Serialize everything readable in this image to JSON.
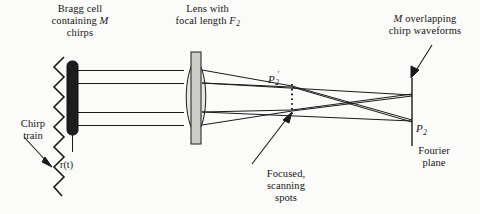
{
  "figure": {
    "type": "optical-system-diagram",
    "background_color": "#fbfbf9",
    "ink_color": "#161616"
  },
  "labels": {
    "bragg_cell": {
      "line1": "Bragg cell",
      "line2_pre": "containing ",
      "line2_italic": "M",
      "line3": "chirps"
    },
    "lens": {
      "line1": "Lens with",
      "line2_pre": "focal length ",
      "line2_italic": "F",
      "line2_sub": "2"
    },
    "overlapping": {
      "line1_italic": "M",
      "line1_post": " overlapping",
      "line2": "chirp waveforms"
    },
    "chirp_train": {
      "line1": "Chirp",
      "line2": "train"
    },
    "input_signal": "r(t)",
    "p2_prime": {
      "symbol": "P",
      "sub": "2",
      "prime": "′"
    },
    "p2": {
      "symbol": "P",
      "sub": "2"
    },
    "fourier_plane": {
      "line1": "Fourier",
      "line2": "plane"
    },
    "focused_spots": {
      "line1": "Focused,",
      "line2": "scanning",
      "line3": "spots"
    }
  },
  "components": {
    "bragg_cell": {
      "name": "Bragg cell",
      "fill": "#1d1d1d",
      "x": 68,
      "y": 62,
      "width": 10,
      "height": 72
    },
    "lens": {
      "name": "Lens",
      "fill": "#d2d2cc",
      "center_x": 196,
      "center_y": 97,
      "half_width": 13,
      "half_height": 38
    },
    "lens_mount": {
      "name": "Lens mount bar",
      "fill": "#c9c9c3",
      "x": 191,
      "y": 52,
      "width": 10,
      "height": 92
    },
    "fourier_plane_line": {
      "name": "Fourier plane",
      "x": 412,
      "y_top": 78,
      "y_bottom": 146
    },
    "p2_prime_line": {
      "name": "P2-prime dotted plane",
      "x": 292,
      "y_top": 84,
      "y_bottom": 113,
      "style": "dotted"
    },
    "chirp_train_zigzag": {
      "name": "Chirp train zigzag",
      "x": 58,
      "y_top": 58,
      "y_bottom": 196,
      "amplitude": 9,
      "periods": 7
    }
  },
  "beams": {
    "collimated_ray_y": [
      70,
      83,
      112,
      125
    ],
    "bragg_exit_x": 78,
    "lens_entry_x": 183,
    "lens_exit_x": 209,
    "focus_x": 292,
    "plane_x": 412
  }
}
